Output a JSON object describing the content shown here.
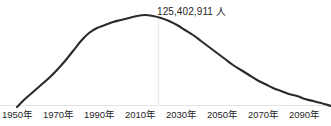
{
  "chart_data": {
    "type": "line",
    "title": "",
    "subtitle": "",
    "xlabel": "",
    "ylabel": "",
    "grid": false,
    "legend": null,
    "annotations": [
      {
        "name": "peak-value",
        "text": "125,402,911 人",
        "value": 125402911,
        "unit": "人",
        "at_x": "2010",
        "anchor_x_px": 157,
        "anchor_y_px": 5
      }
    ],
    "axis": {
      "x_tick_labels": [
        "1950年",
        "1970年",
        "1990年",
        "2010年",
        "2030年",
        "2050年",
        "2070年",
        "2090年"
      ],
      "x_tick_values": [
        1950,
        1970,
        1990,
        2010,
        2030,
        2050,
        2070,
        2090
      ],
      "x_tick_label_left_px": [
        2,
        43,
        84,
        125,
        166,
        207,
        248,
        289
      ],
      "xlim": [
        1947,
        2100
      ],
      "ylim": [
        0,
        140000000
      ],
      "y_tick_labels": []
    },
    "series": [
      {
        "name": "population",
        "color": "#2b2b2b",
        "line_width_px": 2.1,
        "x": [
          1947,
          1950,
          1955,
          1960,
          1965,
          1970,
          1975,
          1980,
          1985,
          1990,
          1995,
          2000,
          2005,
          2010,
          2015,
          2020,
          2025,
          2030,
          2035,
          2040,
          2045,
          2050,
          2055,
          2060,
          2065,
          2070,
          2075,
          2080,
          2085,
          2090,
          2095,
          2100
        ],
        "values": [
          78000000,
          83200000,
          89300000,
          93400000,
          98300000,
          103700000,
          111900000,
          117100000,
          121000000,
          123600000,
          125600000,
          126900000,
          127800000,
          128100000,
          127100000,
          126100000,
          123700000,
          120100000,
          116600000,
          112900000,
          108800000,
          104700000,
          100500000,
          96100000,
          91600000,
          87000000,
          82500000,
          78100000,
          74000000,
          70000000,
          66500000,
          63500000
        ],
        "pixel_path": [
          {
            "x": 17,
            "y": 107
          },
          {
            "x": 25,
            "y": 99
          },
          {
            "x": 33,
            "y": 92
          },
          {
            "x": 41,
            "y": 85
          },
          {
            "x": 49,
            "y": 78
          },
          {
            "x": 57,
            "y": 70
          },
          {
            "x": 65,
            "y": 61
          },
          {
            "x": 73,
            "y": 51
          },
          {
            "x": 81,
            "y": 41
          },
          {
            "x": 89,
            "y": 33
          },
          {
            "x": 97,
            "y": 28
          },
          {
            "x": 105,
            "y": 25
          },
          {
            "x": 113,
            "y": 22
          },
          {
            "x": 121,
            "y": 20
          },
          {
            "x": 129,
            "y": 18
          },
          {
            "x": 137,
            "y": 16
          },
          {
            "x": 145,
            "y": 15
          },
          {
            "x": 153,
            "y": 16
          },
          {
            "x": 161,
            "y": 18
          },
          {
            "x": 169,
            "y": 21
          },
          {
            "x": 177,
            "y": 25
          },
          {
            "x": 185,
            "y": 30
          },
          {
            "x": 193,
            "y": 35
          },
          {
            "x": 201,
            "y": 41
          },
          {
            "x": 209,
            "y": 47
          },
          {
            "x": 217,
            "y": 53
          },
          {
            "x": 225,
            "y": 59
          },
          {
            "x": 233,
            "y": 65
          },
          {
            "x": 241,
            "y": 70
          },
          {
            "x": 249,
            "y": 75
          },
          {
            "x": 257,
            "y": 80
          },
          {
            "x": 265,
            "y": 84
          },
          {
            "x": 273,
            "y": 88
          },
          {
            "x": 281,
            "y": 91
          },
          {
            "x": 289,
            "y": 94
          },
          {
            "x": 297,
            "y": 96
          },
          {
            "x": 305,
            "y": 99
          },
          {
            "x": 313,
            "y": 101
          },
          {
            "x": 321,
            "y": 103
          },
          {
            "x": 331,
            "y": 106
          }
        ]
      }
    ],
    "reference_line": {
      "name": "peak-marker",
      "orientation": "vertical",
      "x_px": 158.5,
      "y_top_px": 17,
      "y_bottom_px": 106,
      "color": "#ededed"
    },
    "baseline": {
      "name": "x-axis-line",
      "y_px": 105.5,
      "x_start_px": 0,
      "x_end_px": 331,
      "color": "#e4e4e4"
    }
  },
  "colors": {
    "background": "#ffffff",
    "line": "#2b2b2b",
    "text": "#262626",
    "axis": "#e4e4e4",
    "gridline": "#ededed"
  }
}
